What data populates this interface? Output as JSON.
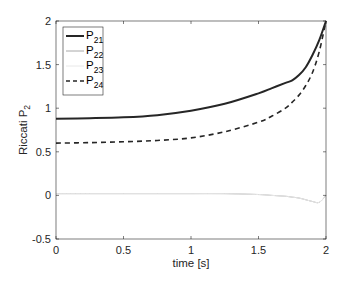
{
  "chart_data": {
    "type": "line",
    "title": "",
    "xlabel": "time [s]",
    "ylabel": "Riccati P",
    "ylabel_subscript": "2",
    "xlim": [
      0,
      2
    ],
    "ylim": [
      -0.5,
      2
    ],
    "xticks": [
      0,
      0.5,
      1,
      1.5,
      2
    ],
    "xtick_labels": [
      "0",
      "0.5",
      "1",
      "1.5",
      "2"
    ],
    "yticks": [
      -0.5,
      0,
      0.5,
      1,
      1.5,
      2
    ],
    "ytick_labels": [
      "-0.5",
      "0",
      "0.5",
      "1",
      "1.5",
      "2"
    ],
    "grid": false,
    "legend_position": "upper left",
    "x": [
      0,
      0.25,
      0.5,
      0.75,
      1.0,
      1.25,
      1.5,
      1.6,
      1.7,
      1.75,
      1.8,
      1.85,
      1.9,
      1.95,
      2.0
    ],
    "series": [
      {
        "name": "P",
        "sub": "21",
        "color": "#262626",
        "width": 2.0,
        "dash": "",
        "values": [
          0.88,
          0.885,
          0.895,
          0.92,
          0.97,
          1.05,
          1.17,
          1.23,
          1.29,
          1.32,
          1.38,
          1.47,
          1.61,
          1.78,
          2.0
        ]
      },
      {
        "name": "P",
        "sub": "22",
        "color": "#a8a8a8",
        "width": 1.0,
        "dash": "",
        "values": [
          0.02,
          0.02,
          0.02,
          0.02,
          0.02,
          0.02,
          0.01,
          0.0,
          -0.01,
          -0.02,
          -0.03,
          -0.05,
          -0.07,
          -0.08,
          0.0
        ]
      },
      {
        "name": "P",
        "sub": "23",
        "color": "#e8e8e8",
        "width": 1.0,
        "dash": "",
        "values": [
          0.02,
          0.02,
          0.02,
          0.02,
          0.02,
          0.02,
          0.01,
          0.0,
          -0.01,
          -0.02,
          -0.03,
          -0.05,
          -0.07,
          -0.08,
          0.0
        ]
      },
      {
        "name": "P",
        "sub": "24",
        "color": "#262626",
        "width": 1.6,
        "dash": "5,4",
        "values": [
          0.6,
          0.605,
          0.615,
          0.63,
          0.66,
          0.73,
          0.84,
          0.91,
          1.0,
          1.07,
          1.15,
          1.26,
          1.41,
          1.65,
          2.0
        ]
      }
    ]
  }
}
